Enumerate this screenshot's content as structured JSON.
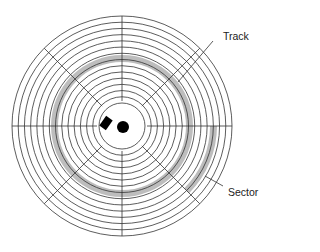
{
  "diagram": {
    "labels": {
      "track": "Track",
      "sector": "Sector"
    },
    "colors": {
      "line": "#333333",
      "highlight": "#bdbdbd",
      "spindle": "#000000"
    },
    "geometry": {
      "center": [
        122,
        126
      ],
      "outer_radius": 110,
      "inner_radius": 23,
      "track_count": 14,
      "radial_divisions": 8,
      "highlighted_track_radii": [
        64,
        71
      ],
      "highlighted_sector_radii": [
        88,
        95
      ],
      "highlighted_sector_angles_deg": [
        0,
        45
      ]
    }
  }
}
